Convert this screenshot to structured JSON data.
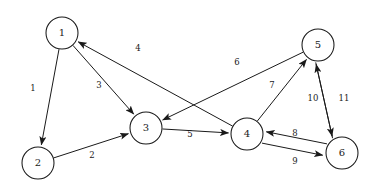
{
  "diagram": {
    "type": "directed-graph",
    "canvas": {
      "width": 372,
      "height": 189
    },
    "style": {
      "background": "#ffffff",
      "stroke": "#1a1a1a",
      "node_fill": "#ffffff",
      "node_radius": 16
    },
    "nodes": [
      {
        "id": "1",
        "label": "1",
        "cx": 62,
        "cy": 33,
        "r": 16
      },
      {
        "id": "2",
        "label": "2",
        "cx": 38,
        "cy": 163,
        "r": 16
      },
      {
        "id": "3",
        "label": "3",
        "cx": 146,
        "cy": 128,
        "r": 16
      },
      {
        "id": "4",
        "label": "4",
        "cx": 247,
        "cy": 134,
        "r": 16
      },
      {
        "id": "5",
        "label": "5",
        "cx": 318,
        "cy": 45,
        "r": 16
      },
      {
        "id": "6",
        "label": "6",
        "cx": 342,
        "cy": 153,
        "r": 16
      }
    ],
    "edges": [
      {
        "from": "1",
        "to": "2",
        "label": "1",
        "label_x": 33,
        "label_y": 88,
        "directed": true
      },
      {
        "from": "1",
        "to": "3",
        "label": "3",
        "label_x": 99,
        "label_y": 85,
        "directed": true
      },
      {
        "from": "2",
        "to": "3",
        "label": "2",
        "label_x": 92,
        "label_y": 155,
        "directed": true
      },
      {
        "from": "3",
        "to": "4",
        "label": "5",
        "label_x": 190,
        "label_y": 134,
        "directed": true
      },
      {
        "from": "4",
        "to": "1",
        "label": "4",
        "label_x": 138,
        "label_y": 48,
        "directed": true
      },
      {
        "from": "5",
        "to": "3",
        "label": "6",
        "label_x": 237,
        "label_y": 62,
        "directed": true
      },
      {
        "from": "4",
        "to": "5",
        "label": "7",
        "label_x": 272,
        "label_y": 85,
        "directed": true
      },
      {
        "from": "6",
        "to": "4",
        "label": "8",
        "label_x": 295,
        "label_y": 133,
        "directed": true
      },
      {
        "from": "4",
        "to": "6",
        "label": "9",
        "label_x": 295,
        "label_y": 161,
        "directed": true
      },
      {
        "from": "5",
        "to": "6",
        "label": "10",
        "label_x": 313,
        "label_y": 98,
        "directed": true
      },
      {
        "from": "6",
        "to": "5",
        "label": "11",
        "label_x": 344,
        "label_y": 98,
        "directed": true
      }
    ]
  }
}
